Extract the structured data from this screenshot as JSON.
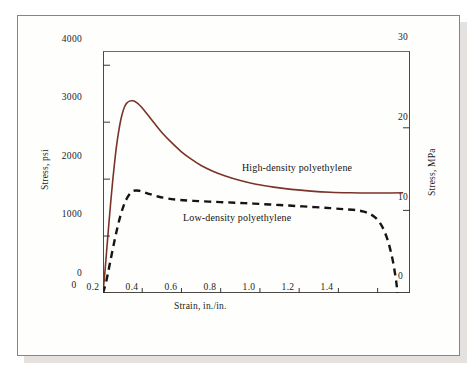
{
  "figure": {
    "background_color": "#fefefd",
    "frame_color": "#8d837b"
  },
  "axes": {
    "left": {
      "title": "Stress, psi",
      "ticks": [
        "0",
        "1000",
        "2000",
        "3000",
        "4000"
      ],
      "min": 0,
      "max": 4250
    },
    "right": {
      "title": "Stress, MPa",
      "ticks": [
        "0",
        "10",
        "20",
        "30"
      ],
      "min": 0,
      "max": 29.3
    },
    "bottom": {
      "title": "Strain, in./in.",
      "ticks": [
        "0",
        "0.2",
        "0.4",
        "0.6",
        "0.8",
        "1.0",
        "1.2",
        "1.4"
      ],
      "min": 0,
      "max": 1.565
    }
  },
  "annotations": {
    "hdpe_label": "High-density polyethylene",
    "ldpe_label": "Low-density polyethylene"
  },
  "chart_data": {
    "type": "line",
    "title": "",
    "xlabel": "Strain, in./in.",
    "ylabel": "Stress, psi",
    "ylabel_secondary": "Stress, MPa",
    "xlim": [
      0,
      1.565
    ],
    "ylim": [
      0,
      4250
    ],
    "ylim_secondary": [
      0,
      29.3
    ],
    "grid": false,
    "legend": "inline-annotations",
    "series": [
      {
        "name": "High-density polyethylene",
        "style": "solid",
        "color": "#7b3328",
        "width": 1.6,
        "points": [
          [
            0.0,
            0
          ],
          [
            0.01,
            380
          ],
          [
            0.02,
            800
          ],
          [
            0.03,
            1220
          ],
          [
            0.04,
            1620
          ],
          [
            0.05,
            1990
          ],
          [
            0.06,
            2320
          ],
          [
            0.07,
            2610
          ],
          [
            0.08,
            2840
          ],
          [
            0.09,
            3030
          ],
          [
            0.1,
            3170
          ],
          [
            0.11,
            3270
          ],
          [
            0.12,
            3330
          ],
          [
            0.135,
            3370
          ],
          [
            0.15,
            3375
          ],
          [
            0.165,
            3360
          ],
          [
            0.18,
            3320
          ],
          [
            0.2,
            3250
          ],
          [
            0.23,
            3120
          ],
          [
            0.26,
            2990
          ],
          [
            0.3,
            2820
          ],
          [
            0.35,
            2640
          ],
          [
            0.4,
            2480
          ],
          [
            0.45,
            2350
          ],
          [
            0.5,
            2240
          ],
          [
            0.56,
            2140
          ],
          [
            0.62,
            2060
          ],
          [
            0.7,
            1975
          ],
          [
            0.78,
            1910
          ],
          [
            0.87,
            1860
          ],
          [
            0.96,
            1820
          ],
          [
            1.06,
            1790
          ],
          [
            1.16,
            1770
          ],
          [
            1.26,
            1760
          ],
          [
            1.36,
            1755
          ],
          [
            1.46,
            1757
          ],
          [
            1.53,
            1760
          ]
        ]
      },
      {
        "name": "Low-density polyethylene",
        "style": "dashed",
        "color": "#141414",
        "width": 2.4,
        "dash": "7,5",
        "points": [
          [
            0.0,
            0
          ],
          [
            0.015,
            180
          ],
          [
            0.03,
            430
          ],
          [
            0.045,
            690
          ],
          [
            0.06,
            940
          ],
          [
            0.075,
            1170
          ],
          [
            0.09,
            1370
          ],
          [
            0.105,
            1530
          ],
          [
            0.12,
            1650
          ],
          [
            0.135,
            1735
          ],
          [
            0.15,
            1785
          ],
          [
            0.165,
            1800
          ],
          [
            0.185,
            1795
          ],
          [
            0.21,
            1770
          ],
          [
            0.24,
            1735
          ],
          [
            0.28,
            1695
          ],
          [
            0.33,
            1660
          ],
          [
            0.39,
            1635
          ],
          [
            0.46,
            1618
          ],
          [
            0.54,
            1605
          ],
          [
            0.63,
            1592
          ],
          [
            0.72,
            1578
          ],
          [
            0.81,
            1562
          ],
          [
            0.9,
            1545
          ],
          [
            0.99,
            1527
          ],
          [
            1.08,
            1508
          ],
          [
            1.16,
            1490
          ],
          [
            1.23,
            1472
          ],
          [
            1.29,
            1455
          ],
          [
            1.33,
            1430
          ],
          [
            1.36,
            1390
          ],
          [
            1.39,
            1320
          ],
          [
            1.415,
            1215
          ],
          [
            1.435,
            1080
          ],
          [
            1.452,
            920
          ],
          [
            1.467,
            730
          ],
          [
            1.48,
            520
          ],
          [
            1.49,
            310
          ],
          [
            1.497,
            140
          ],
          [
            1.5,
            0
          ]
        ]
      }
    ]
  }
}
